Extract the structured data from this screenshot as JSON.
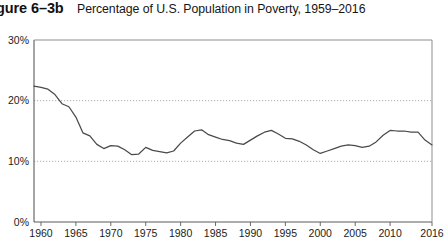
{
  "figure": {
    "number_label": "gure 6–3b",
    "title": "Percentage of U.S. Population in Poverty, 1959–2016"
  },
  "chart_data": {
    "type": "line",
    "title": "Percentage of U.S. Population in Poverty, 1959–2016",
    "xlabel": "",
    "ylabel": "",
    "xlim": [
      1959,
      2016
    ],
    "ylim": [
      0,
      30
    ],
    "grid": "horizontal-dotted-at-10-and-20",
    "legend": "none",
    "line_color": "#4a4a4a",
    "gridline_color": "#9a9a9a",
    "axis_color": "#555555",
    "ytick_labels": [
      "0%",
      "10%",
      "20%",
      "30%"
    ],
    "ytick_values": [
      0,
      10,
      20,
      30
    ],
    "xtick_labels": [
      "1960",
      "1965",
      "1970",
      "1975",
      "1980",
      "1985",
      "1990",
      "1995",
      "2000",
      "2005",
      "2010",
      "2016"
    ],
    "xtick_values": [
      1960,
      1965,
      1970,
      1975,
      1980,
      1985,
      1990,
      1995,
      2000,
      2005,
      2010,
      2016
    ],
    "x": [
      1959,
      1960,
      1961,
      1962,
      1963,
      1964,
      1965,
      1966,
      1967,
      1968,
      1969,
      1970,
      1971,
      1972,
      1973,
      1974,
      1975,
      1976,
      1977,
      1978,
      1979,
      1980,
      1981,
      1982,
      1983,
      1984,
      1985,
      1986,
      1987,
      1988,
      1989,
      1990,
      1991,
      1992,
      1993,
      1994,
      1995,
      1996,
      1997,
      1998,
      1999,
      2000,
      2001,
      2002,
      2003,
      2004,
      2005,
      2006,
      2007,
      2008,
      2009,
      2010,
      2011,
      2012,
      2013,
      2014,
      2015,
      2016
    ],
    "values": [
      22.4,
      22.2,
      21.9,
      21.0,
      19.5,
      19.0,
      17.3,
      14.7,
      14.2,
      12.8,
      12.1,
      12.6,
      12.5,
      11.9,
      11.1,
      11.2,
      12.3,
      11.8,
      11.6,
      11.4,
      11.7,
      13.0,
      14.0,
      15.0,
      15.2,
      14.4,
      14.0,
      13.6,
      13.4,
      13.0,
      12.8,
      13.5,
      14.2,
      14.8,
      15.1,
      14.5,
      13.8,
      13.7,
      13.3,
      12.7,
      11.9,
      11.3,
      11.7,
      12.1,
      12.5,
      12.7,
      12.6,
      12.3,
      12.5,
      13.2,
      14.3,
      15.1,
      15.0,
      15.0,
      14.8,
      14.8,
      13.5,
      12.7
    ],
    "series_name": "Percentage of U.S. population in poverty"
  }
}
